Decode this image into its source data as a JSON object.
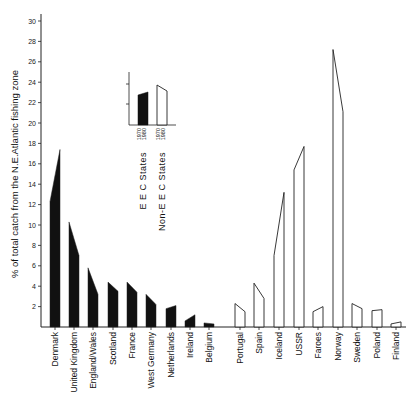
{
  "chart_data": {
    "type": "bar",
    "title": "",
    "xlabel": "",
    "ylabel": "% of total catch from the N.E.Atlantic fishing zone",
    "ylim": [
      0,
      30
    ],
    "yticks": [
      2,
      4,
      6,
      8,
      10,
      12,
      14,
      16,
      18,
      20,
      22,
      24,
      26,
      28,
      30
    ],
    "grid": false,
    "bar_style": "each bar drawn as trapezoid from 1970 value (left) to 1980 value (right)",
    "categories": [
      "Denmark",
      "United Kingdom",
      "England/Wales",
      "Scotland",
      "France",
      "West Germany",
      "Netherlands",
      "Ireland",
      "Belgium",
      "Portugal",
      "Spain",
      "Iceland",
      "USSR",
      "Faroes",
      "Norway",
      "Sweden",
      "Poland",
      "Finland"
    ],
    "groups": [
      "EEC",
      "EEC",
      "EEC",
      "EEC",
      "EEC",
      "EEC",
      "EEC",
      "EEC",
      "EEC",
      "Non-EEC",
      "Non-EEC",
      "Non-EEC",
      "Non-EEC",
      "Non-EEC",
      "Non-EEC",
      "Non-EEC",
      "Non-EEC",
      "Non-EEC"
    ],
    "series": [
      {
        "name": "1970",
        "values": [
          12.3,
          10.3,
          5.8,
          4.4,
          4.4,
          3.2,
          1.8,
          0.6,
          0.4,
          2.3,
          4.3,
          7.0,
          15.4,
          1.5,
          27.2,
          2.3,
          1.6,
          0.3
        ]
      },
      {
        "name": "1980",
        "values": [
          17.4,
          7.0,
          3.2,
          3.5,
          3.4,
          2.2,
          2.1,
          1.2,
          0.3,
          1.5,
          2.8,
          13.2,
          17.7,
          2.0,
          21.1,
          1.8,
          1.7,
          0.5
        ]
      }
    ],
    "legend": {
      "position": "inset upper-left",
      "entries": [
        {
          "label": "E E C  States",
          "style": "filled black",
          "years": [
            "1970",
            "1980"
          ]
        },
        {
          "label": "Non-E E C  States",
          "style": "outline",
          "years": [
            "1970",
            "1980"
          ]
        }
      ]
    }
  },
  "colors": {
    "eec_fill": "#111111",
    "non_eec_fill": "#ffffff",
    "stroke": "#222222"
  }
}
